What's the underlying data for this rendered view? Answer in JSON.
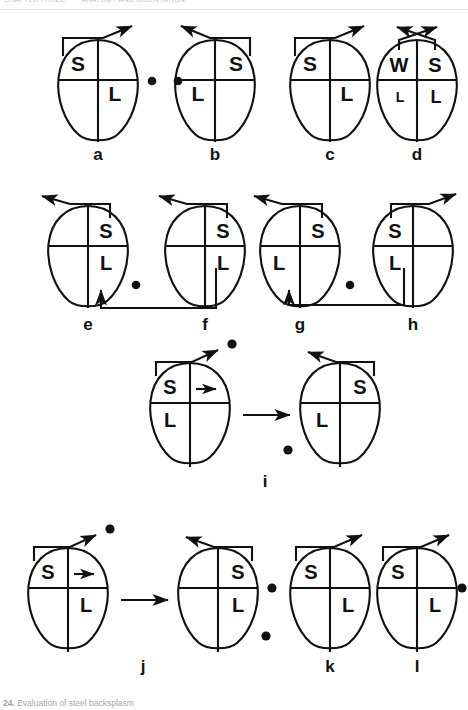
{
  "header": {
    "running_text": "CHAPTER THREE   · · ·   ANATOMY AND ORIENTATION",
    "visible": true
  },
  "caption": {
    "number": "24.",
    "text": "Evaluation of steel backsplasm"
  },
  "figure": {
    "title": "Evaluation of steel backsplasm",
    "panel_count": 12,
    "label_set": [
      "a",
      "b",
      "c",
      "d",
      "e",
      "f",
      "g",
      "h",
      "i",
      "j",
      "k",
      "l"
    ]
  },
  "glyphs": {
    "S": "S",
    "L": "L",
    "W": "W",
    "small_L": "L"
  },
  "colors": {
    "stroke": "#111111",
    "background": "#ffffff",
    "dot": "#111111",
    "caption": "#6f6f76"
  },
  "panels": [
    {
      "id": "a",
      "label": "a",
      "row": 1,
      "quadrant_labels": {
        "top_left": "S",
        "bottom_right": "L"
      },
      "arrow": "up-right",
      "dots": [
        "right"
      ]
    },
    {
      "id": "b",
      "label": "b",
      "row": 1,
      "quadrant_labels": {
        "top_right": "S",
        "bottom_left": "L"
      },
      "arrow": "up-left",
      "dots": [
        "left"
      ]
    },
    {
      "id": "c",
      "label": "c",
      "row": 1,
      "quadrant_labels": {
        "top_left": "S",
        "bottom_right": "L"
      },
      "arrow": "up-right",
      "dots": []
    },
    {
      "id": "d",
      "label": "d",
      "row": 1,
      "quadrant_labels": {
        "top_left": "W",
        "top_right": "S",
        "bottom_left": "L",
        "bottom_right": "L"
      },
      "arrow": "crossed-double",
      "dots": []
    },
    {
      "id": "e",
      "label": "e",
      "row": 2,
      "quadrant_labels": {
        "top_right": "S",
        "bottom_right": "L"
      },
      "arrow": "up-left",
      "dots": [
        "right"
      ],
      "connector": "receives-from-f"
    },
    {
      "id": "f",
      "label": "f",
      "row": 2,
      "quadrant_labels": {
        "top_right": "S",
        "bottom_right": "L"
      },
      "arrow": "up-left",
      "dots": [],
      "connector": "sends-to-e"
    },
    {
      "id": "g",
      "label": "g",
      "row": 2,
      "quadrant_labels": {
        "top_right": "S",
        "bottom_left": "L"
      },
      "arrow": "up-left",
      "dots": [
        "right"
      ],
      "connector": "receives-from-h"
    },
    {
      "id": "h",
      "label": "h",
      "row": 2,
      "quadrant_labels": {
        "top_left": "S",
        "bottom_left": "L"
      },
      "arrow": "up-right",
      "dots": [],
      "connector": "sends-to-g"
    },
    {
      "id": "i",
      "label": "i",
      "row": 3,
      "pair": true,
      "left": {
        "quadrant_labels": {
          "top_left": "S",
          "bottom_left": "L"
        },
        "arrow": "up-right",
        "inner_arrow": "right",
        "dots": [
          "arrow-tip"
        ]
      },
      "right": {
        "quadrant_labels": {
          "top_right": "S",
          "bottom_left": "L"
        },
        "arrow": "up-left",
        "dots": [
          "lower-left"
        ]
      },
      "transition_arrow": "right"
    },
    {
      "id": "j",
      "label": "j",
      "row": 4,
      "pair": true,
      "left": {
        "quadrant_labels": {
          "top_left": "S",
          "bottom_right": "L"
        },
        "arrow": "up-right",
        "inner_arrow": "right",
        "dots": [
          "arrow-tip"
        ]
      },
      "right": {
        "quadrant_labels": {
          "top_right": "S",
          "bottom_right": "L"
        },
        "arrow": "up-left",
        "dots": [
          "lower-right"
        ]
      },
      "transition_arrow": "right"
    },
    {
      "id": "k",
      "label": "k",
      "row": 4,
      "quadrant_labels": {
        "top_left": "S",
        "bottom_right": "L"
      },
      "arrow": "up-right",
      "dots": [
        "left"
      ]
    },
    {
      "id": "l",
      "label": "l",
      "row": 4,
      "quadrant_labels": {
        "top_left": "S",
        "bottom_right": "L"
      },
      "arrow": "up-right",
      "dots": [
        "right"
      ]
    }
  ]
}
